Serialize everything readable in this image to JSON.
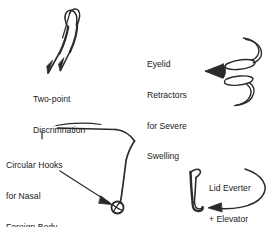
{
  "figure": {
    "background_color": "#ffffff",
    "ink_color": "#2b2b2b",
    "width": 278,
    "height": 227
  },
  "labels": {
    "two_point": {
      "line1": "Two-point",
      "line2": "Discrimnation",
      "text": "Two-point\nDiscrimnation"
    },
    "eyelid_retractors": {
      "line1": "Eyelid",
      "line2": "Retractors",
      "line3": "for Severe",
      "line4": "Swelling",
      "text": "Eyelid\nRetractors\nfor Severe\nSwelling"
    },
    "circular_hooks": {
      "line1": "Circular Hooks",
      "line2": "for Nasal",
      "line3": "Foreign Body",
      "text": "Circular Hooks\nfor Nasal\nForeign Body"
    },
    "lid_everter": {
      "line1": "Lid Everter",
      "line2": "+ Elevator",
      "text": "Lid Everter\n+ Elevator"
    }
  },
  "instruments": [
    {
      "name": "two-point-discriminator",
      "label": "Two-point Discrimnation",
      "position": "top-left"
    },
    {
      "name": "eyelid-retractors",
      "label": "Eyelid Retractors for Severe Swelling",
      "position": "top-right"
    },
    {
      "name": "circular-hooks",
      "label": "Circular Hooks for Nasal Foreign Body",
      "position": "center"
    },
    {
      "name": "lid-everter-elevator",
      "label": "Lid Everter + Elevator",
      "position": "bottom-right"
    }
  ]
}
